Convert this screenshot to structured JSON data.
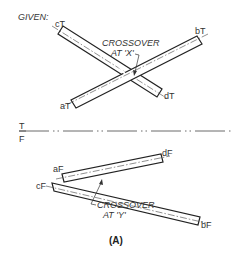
{
  "figure": {
    "caption": "(A)",
    "given_label": "GIVEN:",
    "fold_line": {
      "upper_label": "T",
      "lower_label": "F"
    },
    "top_view": {
      "crossover_note_line1": "CROSSOVER",
      "crossover_note_line2": "AT 'X'",
      "points": {
        "c": "cT",
        "b": "bT",
        "a": "aT",
        "d": "dT"
      }
    },
    "front_view": {
      "crossover_note_line1": "CROSSOVER",
      "crossover_note_line2": "AT 'Y'",
      "points": {
        "a": "aF",
        "d": "dF",
        "c": "cF",
        "b": "bF"
      }
    },
    "colors": {
      "line": "#222222",
      "background": "#ffffff"
    }
  }
}
